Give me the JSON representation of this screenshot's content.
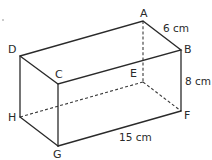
{
  "figure": {
    "type": "rectangular-prism",
    "vertices": {
      "A": {
        "label": "A",
        "x": 143,
        "y": 21
      },
      "B": {
        "label": "B",
        "x": 181,
        "y": 50
      },
      "C": {
        "label": "C",
        "x": 58,
        "y": 84
      },
      "D": {
        "label": "D",
        "x": 20,
        "y": 56
      },
      "E": {
        "label": "E",
        "x": 143,
        "y": 82
      },
      "F": {
        "label": "F",
        "x": 181,
        "y": 111
      },
      "G": {
        "label": "G",
        "x": 58,
        "y": 146
      },
      "H": {
        "label": "H",
        "x": 20,
        "y": 117
      }
    },
    "dimensions": {
      "depth": "6 cm",
      "height": "8 cm",
      "length": "15 cm"
    },
    "visible_edges": [
      "AB",
      "AD",
      "DC",
      "CB",
      "BF",
      "CG",
      "DH",
      "HG",
      "GF"
    ],
    "hidden_edges": [
      "AE",
      "EF",
      "EH"
    ]
  }
}
